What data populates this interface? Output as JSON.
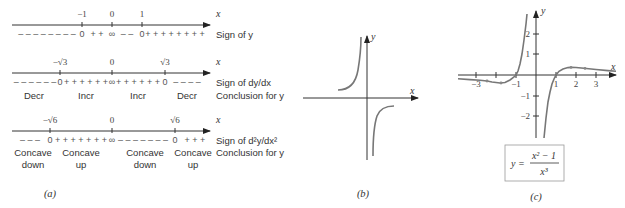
{
  "panel_a": {
    "caption": "(a)",
    "line1": {
      "axis_label": "x",
      "ticks": [
        "−1",
        "0",
        "1"
      ],
      "signs": [
        "– – – – – – – –",
        "0",
        "+ +",
        "∞",
        "– –",
        "0",
        "+ + + + + + + +"
      ],
      "row_label": "Sign of y"
    },
    "line2": {
      "axis_label": "x",
      "ticks": [
        "−√3",
        "0",
        "√3"
      ],
      "signs": [
        "– – – – – –",
        "0",
        "+ + + + + +",
        "∞",
        "+ + + + + +",
        "0",
        "– – – –"
      ],
      "row_label": "Sign of dy/dx",
      "conclusions": [
        "Decr",
        "Incr",
        "Incr",
        "Decr"
      ],
      "conclusion_label": "Conclusion for y"
    },
    "line3": {
      "axis_label": "x",
      "ticks": [
        "−√6",
        "0",
        "√6"
      ],
      "signs": [
        "– – –",
        "0",
        "+ + + + + + +",
        "∞",
        "– – – – – – –",
        "0",
        "+ + +"
      ],
      "row_label": "Sign of d²y/dx²",
      "conclusions_top": [
        "Concave",
        "Concave",
        "Concave",
        "Concave"
      ],
      "conclusions_bottom": [
        "down",
        "up",
        "down",
        "up"
      ],
      "conclusion_label": "Conclusion for y"
    }
  },
  "panel_b": {
    "caption": "(b)",
    "x_label": "x",
    "y_label": "y"
  },
  "panel_c": {
    "caption": "(c)",
    "x_label": "x",
    "y_label": "y",
    "x_ticks": [
      "−3",
      "−1",
      "1",
      "2",
      "3"
    ],
    "y_ticks": [
      "2",
      "1",
      "−1",
      "−2"
    ],
    "formula": {
      "lhs": "y =",
      "numerator": "x² − 1",
      "denominator": "x³"
    }
  }
}
